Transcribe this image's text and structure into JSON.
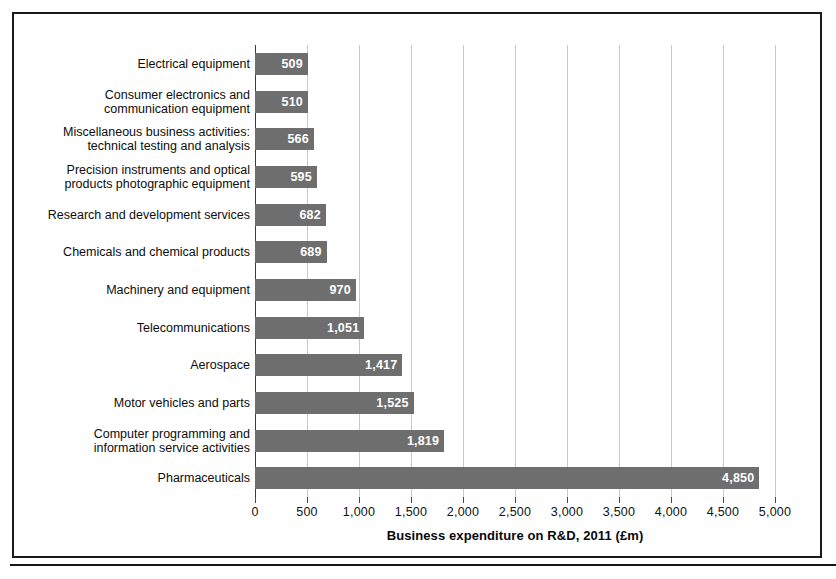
{
  "chart_data": {
    "type": "bar",
    "orientation": "horizontal",
    "title": "",
    "xlabel": "Business expenditure on R&D, 2011 (£m)",
    "ylabel": "",
    "xlim": [
      0,
      5000
    ],
    "grid": true,
    "legend": false,
    "bar_color": "#6e6e6e",
    "value_label_color": "#ffffff",
    "xticks": [
      0,
      500,
      1000,
      1500,
      2000,
      2500,
      3000,
      3500,
      4000,
      4500,
      5000
    ],
    "xticklabels": [
      "0",
      "500",
      "1,000",
      "1,500",
      "2,000",
      "2,500",
      "3,000",
      "3,500",
      "4,000",
      "4,500",
      "5,000"
    ],
    "categories": [
      "Electrical equipment",
      "Consumer electronics and\ncommunication equipment",
      "Miscellaneous business activities:\ntechnical testing and analysis",
      "Precision instruments and optical\nproducts photographic equipment",
      "Research and development services",
      "Chemicals and chemical products",
      "Machinery and equipment",
      "Telecommunications",
      "Aerospace",
      "Motor vehicles and parts",
      "Computer programming and\ninformation service activities",
      "Pharmaceuticals"
    ],
    "values": [
      509,
      510,
      566,
      595,
      682,
      689,
      970,
      1051,
      1417,
      1525,
      1819,
      4850
    ],
    "value_labels": [
      "509",
      "510",
      "566",
      "595",
      "682",
      "689",
      "970",
      "1,051",
      "1,417",
      "1,525",
      "1,819",
      "4,850"
    ]
  }
}
